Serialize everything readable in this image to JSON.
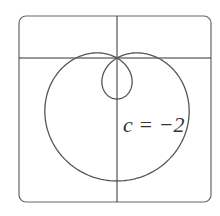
{
  "chart_data": {
    "type": "line",
    "subtype": "polar-curve",
    "title": "",
    "equation": "r = 1 + c sin(theta)",
    "parameter": {
      "name": "c",
      "value": -2
    },
    "annotation": "c = −2",
    "theta_range": [
      0,
      6.2832
    ],
    "origin_px": [
      117,
      58
    ],
    "scale_px_per_unit": 41,
    "frame": {
      "x": 19,
      "y": 16,
      "width": 192,
      "height": 186,
      "radius": 7
    },
    "axes": {
      "x_axis_y_px": 58,
      "y_axis_x_px": 117,
      "grid": false
    },
    "stroke_color": "#555555",
    "axis_color": "#333333"
  },
  "labels": {
    "annotation": "c = −2"
  }
}
